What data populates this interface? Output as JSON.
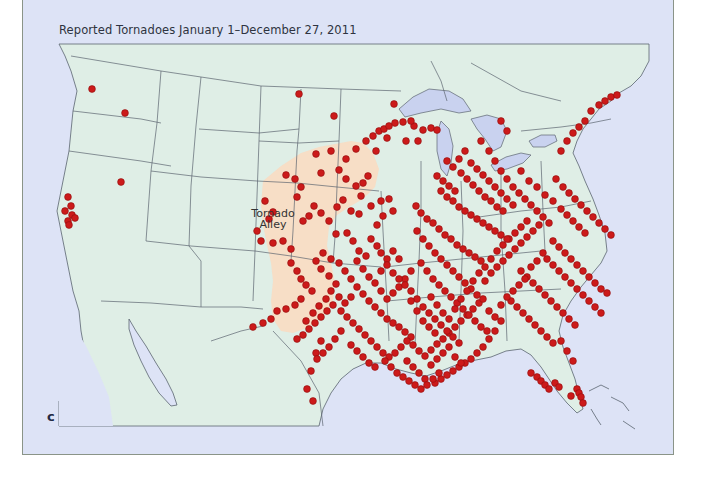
{
  "title": "Reported Tornadoes January 1–December 27, 2011",
  "region_label": {
    "line1": "Tornado",
    "line2": "Alley"
  },
  "panel_letter": "c",
  "colors": {
    "ocean": "#dde3f6",
    "land": "#dfeee6",
    "lakes": "#c9d2ef",
    "tornado_alley": "#f8dcc4",
    "border_lines": "#5b6470",
    "tornado_dot": "#cc1a1a",
    "tornado_dot_edge": "#8e0e0e"
  },
  "legend": {
    "marker": "red-dot",
    "meaning": "Reported tornado"
  },
  "map": {
    "type": "dot-distribution",
    "extent": "Continental United States, southern Canada, northern Mexico",
    "highlight_region": "Tornado Alley"
  },
  "dots": [
    [
      91,
      88
    ],
    [
      124,
      112
    ],
    [
      120,
      181
    ],
    [
      67,
      196
    ],
    [
      70,
      205
    ],
    [
      64,
      210
    ],
    [
      71,
      214
    ],
    [
      67,
      220
    ],
    [
      74,
      217
    ],
    [
      68,
      224
    ],
    [
      298,
      93
    ],
    [
      333,
      115
    ],
    [
      393,
      103
    ],
    [
      375,
      150
    ],
    [
      386,
      137
    ],
    [
      405,
      140
    ],
    [
      413,
      125
    ],
    [
      417,
      140
    ],
    [
      422,
      129
    ],
    [
      430,
      127
    ],
    [
      436,
      129
    ],
    [
      315,
      153
    ],
    [
      320,
      172
    ],
    [
      330,
      150
    ],
    [
      345,
      158
    ],
    [
      355,
      148
    ],
    [
      365,
      140
    ],
    [
      372,
      135
    ],
    [
      378,
      130
    ],
    [
      383,
      128
    ],
    [
      388,
      125
    ],
    [
      394,
      122
    ],
    [
      402,
      121
    ],
    [
      410,
      120
    ],
    [
      338,
      169
    ],
    [
      345,
      178
    ],
    [
      355,
      185
    ],
    [
      362,
      182
    ],
    [
      367,
      175
    ],
    [
      360,
      195
    ],
    [
      370,
      205
    ],
    [
      380,
      200
    ],
    [
      388,
      198
    ],
    [
      392,
      210
    ],
    [
      382,
      215
    ],
    [
      376,
      224
    ],
    [
      313,
      205
    ],
    [
      308,
      215
    ],
    [
      302,
      220
    ],
    [
      320,
      212
    ],
    [
      328,
      220
    ],
    [
      336,
      206
    ],
    [
      342,
      199
    ],
    [
      350,
      210
    ],
    [
      358,
      213
    ],
    [
      294,
      178
    ],
    [
      300,
      186
    ],
    [
      296,
      196
    ],
    [
      285,
      174
    ],
    [
      264,
      200
    ],
    [
      272,
      211
    ],
    [
      268,
      218
    ],
    [
      256,
      230
    ],
    [
      260,
      240
    ],
    [
      272,
      242
    ],
    [
      282,
      240
    ],
    [
      290,
      248
    ],
    [
      335,
      233
    ],
    [
      346,
      232
    ],
    [
      352,
      240
    ],
    [
      358,
      250
    ],
    [
      365,
      255
    ],
    [
      370,
      238
    ],
    [
      376,
      245
    ],
    [
      380,
      252
    ],
    [
      386,
      258
    ],
    [
      392,
      250
    ],
    [
      398,
      258
    ],
    [
      290,
      262
    ],
    [
      296,
      270
    ],
    [
      300,
      278
    ],
    [
      305,
      284
    ],
    [
      311,
      290
    ],
    [
      300,
      298
    ],
    [
      294,
      304
    ],
    [
      285,
      308
    ],
    [
      276,
      310
    ],
    [
      270,
      318
    ],
    [
      262,
      322
    ],
    [
      252,
      326
    ],
    [
      305,
      320
    ],
    [
      312,
      312
    ],
    [
      318,
      305
    ],
    [
      325,
      298
    ],
    [
      330,
      290
    ],
    [
      335,
      283
    ],
    [
      328,
      275
    ],
    [
      320,
      268
    ],
    [
      315,
      260
    ],
    [
      322,
      252
    ],
    [
      330,
      258
    ],
    [
      338,
      262
    ],
    [
      344,
      270
    ],
    [
      350,
      278
    ],
    [
      356,
      286
    ],
    [
      362,
      293
    ],
    [
      368,
      300
    ],
    [
      374,
      306
    ],
    [
      380,
      312
    ],
    [
      386,
      318
    ],
    [
      392,
      322
    ],
    [
      398,
      326
    ],
    [
      404,
      331
    ],
    [
      410,
      336
    ],
    [
      340,
      310
    ],
    [
      346,
      316
    ],
    [
      352,
      322
    ],
    [
      358,
      328
    ],
    [
      364,
      334
    ],
    [
      370,
      340
    ],
    [
      376,
      346
    ],
    [
      382,
      352
    ],
    [
      388,
      356
    ],
    [
      394,
      352
    ],
    [
      400,
      346
    ],
    [
      406,
      340
    ],
    [
      412,
      344
    ],
    [
      418,
      350
    ],
    [
      424,
      355
    ],
    [
      430,
      349
    ],
    [
      436,
      343
    ],
    [
      442,
      338
    ],
    [
      448,
      332
    ],
    [
      454,
      326
    ],
    [
      460,
      320
    ],
    [
      466,
      314
    ],
    [
      472,
      308
    ],
    [
      478,
      302
    ],
    [
      415,
      205
    ],
    [
      420,
      212
    ],
    [
      426,
      218
    ],
    [
      432,
      222
    ],
    [
      438,
      228
    ],
    [
      444,
      234
    ],
    [
      450,
      238
    ],
    [
      456,
      244
    ],
    [
      462,
      248
    ],
    [
      468,
      252
    ],
    [
      474,
      256
    ],
    [
      480,
      260
    ],
    [
      416,
      230
    ],
    [
      422,
      238
    ],
    [
      428,
      245
    ],
    [
      434,
      252
    ],
    [
      440,
      258
    ],
    [
      446,
      264
    ],
    [
      452,
      270
    ],
    [
      458,
      276
    ],
    [
      464,
      282
    ],
    [
      470,
      288
    ],
    [
      476,
      294
    ],
    [
      482,
      298
    ],
    [
      420,
      262
    ],
    [
      426,
      270
    ],
    [
      432,
      278
    ],
    [
      438,
      284
    ],
    [
      444,
      290
    ],
    [
      450,
      296
    ],
    [
      456,
      302
    ],
    [
      462,
      308
    ],
    [
      468,
      314
    ],
    [
      474,
      320
    ],
    [
      480,
      326
    ],
    [
      486,
      330
    ],
    [
      410,
      270
    ],
    [
      404,
      278
    ],
    [
      398,
      286
    ],
    [
      392,
      292
    ],
    [
      386,
      298
    ],
    [
      380,
      290
    ],
    [
      374,
      282
    ],
    [
      368,
      276
    ],
    [
      362,
      268
    ],
    [
      356,
      260
    ],
    [
      410,
      290
    ],
    [
      416,
      298
    ],
    [
      422,
      306
    ],
    [
      428,
      312
    ],
    [
      434,
      318
    ],
    [
      440,
      324
    ],
    [
      446,
      330
    ],
    [
      452,
      336
    ],
    [
      458,
      342
    ],
    [
      430,
      296
    ],
    [
      436,
      304
    ],
    [
      442,
      312
    ],
    [
      448,
      318
    ],
    [
      454,
      308
    ],
    [
      460,
      298
    ],
    [
      466,
      290
    ],
    [
      472,
      280
    ],
    [
      478,
      272
    ],
    [
      484,
      266
    ],
    [
      490,
      258
    ],
    [
      496,
      250
    ],
    [
      502,
      244
    ],
    [
      508,
      238
    ],
    [
      514,
      232
    ],
    [
      520,
      226
    ],
    [
      526,
      220
    ],
    [
      440,
      190
    ],
    [
      446,
      196
    ],
    [
      452,
      200
    ],
    [
      458,
      206
    ],
    [
      464,
      210
    ],
    [
      470,
      214
    ],
    [
      476,
      218
    ],
    [
      482,
      222
    ],
    [
      488,
      226
    ],
    [
      494,
      230
    ],
    [
      500,
      234
    ],
    [
      506,
      238
    ],
    [
      436,
      175
    ],
    [
      442,
      180
    ],
    [
      448,
      185
    ],
    [
      454,
      190
    ],
    [
      460,
      172
    ],
    [
      466,
      178
    ],
    [
      472,
      184
    ],
    [
      478,
      190
    ],
    [
      484,
      196
    ],
    [
      490,
      200
    ],
    [
      496,
      206
    ],
    [
      502,
      210
    ],
    [
      446,
      160
    ],
    [
      452,
      166
    ],
    [
      458,
      158
    ],
    [
      464,
      150
    ],
    [
      470,
      162
    ],
    [
      476,
      168
    ],
    [
      482,
      174
    ],
    [
      488,
      180
    ],
    [
      494,
      186
    ],
    [
      500,
      192
    ],
    [
      506,
      198
    ],
    [
      512,
      204
    ],
    [
      480,
      140
    ],
    [
      488,
      150
    ],
    [
      494,
      160
    ],
    [
      500,
      170
    ],
    [
      506,
      178
    ],
    [
      512,
      186
    ],
    [
      518,
      192
    ],
    [
      524,
      198
    ],
    [
      530,
      204
    ],
    [
      536,
      210
    ],
    [
      542,
      216
    ],
    [
      548,
      222
    ],
    [
      500,
      120
    ],
    [
      506,
      130
    ],
    [
      520,
      170
    ],
    [
      528,
      180
    ],
    [
      536,
      186
    ],
    [
      544,
      194
    ],
    [
      552,
      200
    ],
    [
      560,
      208
    ],
    [
      566,
      214
    ],
    [
      572,
      220
    ],
    [
      578,
      226
    ],
    [
      584,
      232
    ],
    [
      560,
      150
    ],
    [
      566,
      140
    ],
    [
      572,
      132
    ],
    [
      578,
      126
    ],
    [
      584,
      120
    ],
    [
      590,
      110
    ],
    [
      598,
      104
    ],
    [
      604,
      100
    ],
    [
      610,
      96
    ],
    [
      616,
      94
    ],
    [
      555,
      178
    ],
    [
      562,
      186
    ],
    [
      568,
      192
    ],
    [
      574,
      198
    ],
    [
      580,
      204
    ],
    [
      586,
      210
    ],
    [
      592,
      216
    ],
    [
      598,
      222
    ],
    [
      604,
      228
    ],
    [
      610,
      234
    ],
    [
      552,
      240
    ],
    [
      558,
      246
    ],
    [
      564,
      252
    ],
    [
      570,
      258
    ],
    [
      576,
      264
    ],
    [
      582,
      270
    ],
    [
      588,
      276
    ],
    [
      594,
      282
    ],
    [
      600,
      288
    ],
    [
      606,
      292
    ],
    [
      546,
      258
    ],
    [
      552,
      264
    ],
    [
      558,
      270
    ],
    [
      564,
      276
    ],
    [
      570,
      282
    ],
    [
      576,
      288
    ],
    [
      582,
      294
    ],
    [
      588,
      300
    ],
    [
      594,
      306
    ],
    [
      600,
      312
    ],
    [
      520,
      270
    ],
    [
      526,
      276
    ],
    [
      532,
      282
    ],
    [
      538,
      288
    ],
    [
      544,
      294
    ],
    [
      550,
      300
    ],
    [
      556,
      306
    ],
    [
      562,
      312
    ],
    [
      568,
      318
    ],
    [
      574,
      324
    ],
    [
      510,
      300
    ],
    [
      516,
      306
    ],
    [
      522,
      312
    ],
    [
      528,
      318
    ],
    [
      534,
      324
    ],
    [
      540,
      330
    ],
    [
      546,
      336
    ],
    [
      552,
      342
    ],
    [
      500,
      320
    ],
    [
      494,
      330
    ],
    [
      488,
      338
    ],
    [
      482,
      346
    ],
    [
      476,
      352
    ],
    [
      470,
      358
    ],
    [
      464,
      362
    ],
    [
      458,
      366
    ],
    [
      452,
      370
    ],
    [
      446,
      374
    ],
    [
      440,
      378
    ],
    [
      434,
      382
    ],
    [
      560,
      340
    ],
    [
      566,
      350
    ],
    [
      572,
      360
    ],
    [
      530,
      372
    ],
    [
      536,
      376
    ],
    [
      540,
      380
    ],
    [
      544,
      384
    ],
    [
      548,
      388
    ],
    [
      554,
      382
    ],
    [
      558,
      386
    ],
    [
      576,
      388
    ],
    [
      578,
      392
    ],
    [
      580,
      396
    ],
    [
      582,
      402
    ],
    [
      570,
      395
    ],
    [
      320,
      340
    ],
    [
      315,
      352
    ],
    [
      310,
      370
    ],
    [
      306,
      388
    ],
    [
      312,
      400
    ],
    [
      406,
      360
    ],
    [
      412,
      366
    ],
    [
      418,
      372
    ],
    [
      424,
      378
    ],
    [
      430,
      364
    ],
    [
      436,
      358
    ],
    [
      442,
      352
    ],
    [
      448,
      346
    ],
    [
      454,
      356
    ],
    [
      460,
      362
    ],
    [
      340,
      330
    ],
    [
      334,
      338
    ],
    [
      328,
      346
    ],
    [
      322,
      352
    ],
    [
      316,
      358
    ],
    [
      350,
      344
    ],
    [
      356,
      350
    ],
    [
      362,
      356
    ],
    [
      368,
      362
    ],
    [
      374,
      366
    ],
    [
      384,
      360
    ],
    [
      390,
      366
    ],
    [
      396,
      372
    ],
    [
      402,
      376
    ],
    [
      408,
      380
    ],
    [
      414,
      384
    ],
    [
      420,
      388
    ],
    [
      426,
      384
    ],
    [
      432,
      378
    ],
    [
      438,
      372
    ],
    [
      380,
      270
    ],
    [
      386,
      264
    ],
    [
      392,
      272
    ],
    [
      398,
      278
    ],
    [
      404,
      284
    ],
    [
      410,
      300
    ],
    [
      416,
      310
    ],
    [
      422,
      320
    ],
    [
      428,
      326
    ],
    [
      434,
      332
    ],
    [
      350,
      296
    ],
    [
      344,
      302
    ],
    [
      338,
      296
    ],
    [
      332,
      304
    ],
    [
      326,
      310
    ],
    [
      320,
      316
    ],
    [
      314,
      322
    ],
    [
      308,
      328
    ],
    [
      302,
      334
    ],
    [
      296,
      338
    ],
    [
      488,
      310
    ],
    [
      494,
      316
    ],
    [
      500,
      304
    ],
    [
      506,
      296
    ],
    [
      512,
      290
    ],
    [
      518,
      284
    ],
    [
      524,
      278
    ],
    [
      530,
      266
    ],
    [
      536,
      260
    ],
    [
      542,
      252
    ],
    [
      484,
      280
    ],
    [
      490,
      272
    ],
    [
      496,
      266
    ],
    [
      502,
      260
    ],
    [
      508,
      254
    ],
    [
      514,
      248
    ],
    [
      520,
      242
    ],
    [
      526,
      236
    ],
    [
      532,
      230
    ],
    [
      538,
      224
    ]
  ]
}
